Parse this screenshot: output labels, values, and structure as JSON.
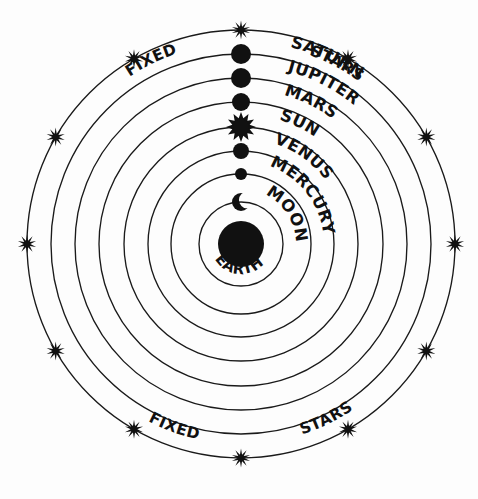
{
  "diagram": {
    "center_label": "EARTH",
    "ink_color": "#111111",
    "background_color": "#ffffff",
    "ring_count": 8,
    "star_count": 12
  },
  "outer_labels": {
    "top_left": "FIXED",
    "top_right": "STARS",
    "bottom_left": "FIXED",
    "bottom_right": "STARS"
  },
  "bodies": [
    {
      "name": "SATURN",
      "label": "SATURN",
      "orbit_radius": 190,
      "body_radius": 10,
      "glyph": "disk",
      "order": 1
    },
    {
      "name": "JUPITER",
      "label": "JUPITER",
      "orbit_radius": 166,
      "body_radius": 10,
      "glyph": "disk",
      "order": 2
    },
    {
      "name": "MARS",
      "label": "MARS",
      "orbit_radius": 142,
      "body_radius": 9,
      "glyph": "disk",
      "order": 3
    },
    {
      "name": "SUN",
      "label": "SUN",
      "orbit_radius": 117,
      "body_radius": 11.5,
      "glyph": "sunburst",
      "order": 4
    },
    {
      "name": "VENUS",
      "label": "VENUS",
      "orbit_radius": 93,
      "body_radius": 8,
      "glyph": "disk",
      "order": 5
    },
    {
      "name": "MERCURY",
      "label": "MERCURY",
      "orbit_radius": 70,
      "body_radius": 6,
      "glyph": "disk",
      "order": 6
    },
    {
      "name": "MOON",
      "label": "MOON",
      "orbit_radius": 42,
      "body_radius": 9,
      "glyph": "crescent",
      "order": 7
    }
  ],
  "earth": {
    "label": "EARTH",
    "radius": 23
  },
  "rings": [
    {
      "name": "fixed-stars-sphere",
      "radius": 214
    },
    {
      "name": "saturn-orbit",
      "radius": 190
    },
    {
      "name": "jupiter-orbit",
      "radius": 166
    },
    {
      "name": "mars-orbit",
      "radius": 142
    },
    {
      "name": "sun-orbit",
      "radius": 117
    },
    {
      "name": "venus-orbit",
      "radius": 93
    },
    {
      "name": "mercury-orbit",
      "radius": 70
    },
    {
      "name": "moon-orbit",
      "radius": 42
    }
  ],
  "geometry": {
    "center_x": 241,
    "center_y": 244
  }
}
